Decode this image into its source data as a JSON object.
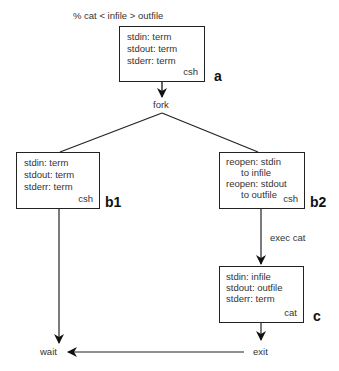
{
  "command": "% cat < infile > outfile",
  "boxes": {
    "a": {
      "lines": [
        "stdin: term",
        "stdout: term",
        "stderr: term"
      ],
      "process": "csh",
      "tag": "a"
    },
    "b1": {
      "lines": [
        "stdin: term",
        "stdout: term",
        "stderr: term"
      ],
      "process": "csh",
      "tag": "b1"
    },
    "b2": {
      "lines": [
        "reopen: stdin",
        "to infile",
        "reopen: stdout",
        "to outfile"
      ],
      "process": "csh",
      "tag": "b2"
    },
    "c": {
      "lines": [
        "stdin:  infile",
        "stdout:  outfile",
        "stderr:  term"
      ],
      "process": "cat",
      "tag": "c"
    }
  },
  "labels": {
    "fork": "fork",
    "exec": "exec cat",
    "wait": "wait",
    "exit": "exit"
  }
}
